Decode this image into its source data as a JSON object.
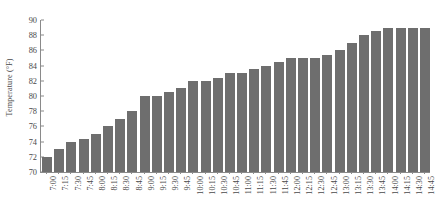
{
  "chart_data": {
    "type": "bar",
    "title": "",
    "xlabel": "",
    "ylabel": "Temperature (°F)",
    "ylim": [
      70,
      90
    ],
    "ytick_step": 2,
    "ytick_labels": [
      "70",
      "72",
      "74",
      "76",
      "78",
      "80",
      "82",
      "84",
      "86",
      "88",
      "90"
    ],
    "grid": false,
    "legend": false,
    "bar_color": "#6e6e6e",
    "axis_color": "#8a8a8a",
    "categories": [
      "7:00",
      "7:15",
      "7:30",
      "7:45",
      "8:00",
      "8:15",
      "8:30",
      "8:45",
      "9:00",
      "9:15",
      "9:30",
      "9:45",
      "10:00",
      "10:15",
      "10:30",
      "10:45",
      "11:00",
      "11:15",
      "11:30",
      "11:45",
      "12:00",
      "12:15",
      "12:30",
      "12:45",
      "13:00",
      "13:15",
      "13:30",
      "13:45",
      "14:00",
      "14:15",
      "14:30",
      "14:45"
    ],
    "values": [
      72,
      73,
      74,
      74.4,
      75,
      76,
      77,
      78,
      80,
      80,
      80.5,
      81,
      82,
      82,
      82.4,
      83,
      83,
      83.5,
      84,
      84.5,
      85,
      85,
      85,
      85.4,
      86,
      87,
      88,
      88.5,
      89,
      89,
      89,
      89
    ]
  }
}
